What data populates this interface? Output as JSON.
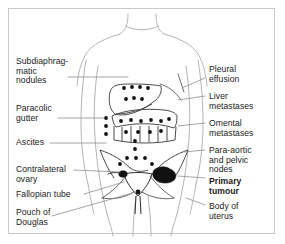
{
  "figure": {
    "title": ""
  },
  "labels_left": [
    {
      "id": "subdiaphragmatic-nodules",
      "text": "Subdiaphrag-\nmatic\nnodules",
      "x": 16,
      "y": 57
    },
    {
      "id": "paracolic-gutter",
      "text": "Paracolic\ngutter",
      "x": 16,
      "y": 104
    },
    {
      "id": "ascites",
      "text": "Ascites",
      "x": 16,
      "y": 138
    },
    {
      "id": "contralateral-ovary",
      "text": "Contralateral\novary",
      "x": 16,
      "y": 165
    },
    {
      "id": "fallopian-tube",
      "text": "Fallopian tube",
      "x": 16,
      "y": 190
    },
    {
      "id": "pouch-of-douglas",
      "text": "Pouch of\nDouglas",
      "x": 16,
      "y": 208
    }
  ],
  "labels_right": [
    {
      "id": "pleural-effusion",
      "text": "Pleural\neffusion",
      "x": 209,
      "y": 65,
      "bold": false
    },
    {
      "id": "liver-metastases",
      "text": "Liver\nmetastases",
      "x": 209,
      "y": 92,
      "bold": false
    },
    {
      "id": "omental-metastases",
      "text": "Omental\nmetastases",
      "x": 209,
      "y": 119,
      "bold": false
    },
    {
      "id": "para-aortic-pelvic-nodes",
      "text": "Para-aortic\nand pelvic\nnodes",
      "x": 209,
      "y": 146,
      "bold": false
    },
    {
      "id": "primary-tumour",
      "text": "Primary\ntumour",
      "x": 209,
      "y": 177,
      "bold": true
    },
    {
      "id": "body-of-uterus",
      "text": "Body of\nuterus",
      "x": 209,
      "y": 202,
      "bold": false
    }
  ],
  "colors": {
    "border": "#c9c9c9",
    "body_outline": "#b5b5b5",
    "organ_outline": "#4a4a4a",
    "leader_line": "#8e8e8e",
    "dot": "#111111",
    "tumour": "#111111",
    "text": "#1a1a1a"
  },
  "deposits": {
    "subdiaphragmatic": [
      [
        124,
        88
      ],
      [
        132,
        87
      ],
      [
        140,
        87
      ],
      [
        148,
        88
      ]
    ],
    "liver": [
      [
        126,
        99
      ],
      [
        134,
        98
      ],
      [
        142,
        99
      ]
    ],
    "paracolic_left": [
      [
        106,
        118
      ],
      [
        106,
        126
      ],
      [
        106,
        134
      ]
    ],
    "omental": [
      [
        121,
        121
      ],
      [
        131,
        120
      ],
      [
        141,
        121
      ],
      [
        151,
        120
      ],
      [
        161,
        121
      ],
      [
        168,
        119
      ],
      [
        126,
        131
      ],
      [
        138,
        131
      ],
      [
        150,
        131
      ],
      [
        160,
        130
      ]
    ],
    "midline_ascites": [
      [
        134,
        140
      ],
      [
        134,
        148
      ],
      [
        127,
        157
      ],
      [
        136,
        157
      ],
      [
        145,
        157
      ],
      [
        120,
        163
      ],
      [
        152,
        163
      ]
    ],
    "pelvic_nodes": [
      [
        127,
        173
      ],
      [
        142,
        173
      ]
    ]
  }
}
